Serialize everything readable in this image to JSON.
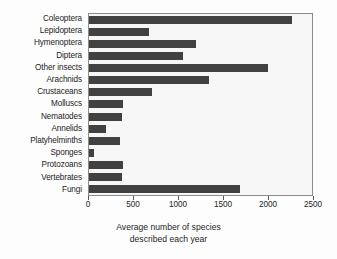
{
  "chart_data": {
    "type": "bar",
    "orientation": "horizontal",
    "title": "",
    "xlabel": "Average number of species described each year",
    "xlabel_lines": [
      "Average number of species",
      "described each year"
    ],
    "ylabel": "",
    "xlim": [
      0,
      2500
    ],
    "xticks": [
      0,
      500,
      1000,
      1500,
      2000,
      2500
    ],
    "xtick_labels": [
      "0",
      "500",
      "1000",
      "1500",
      "2000",
      "2500"
    ],
    "grid": false,
    "legend": false,
    "bar_color": "#414141",
    "plot_background": "#f7f7f7",
    "frame_color": "#8c8c8c",
    "categories": [
      "Coleoptera",
      "Lepidoptera",
      "Hymenoptera",
      "Diptera",
      "Other insects",
      "Arachnids",
      "Crustaceans",
      "Molluscs",
      "Nematodes",
      "Annelids",
      "Platyhelminths",
      "Sponges",
      "Protozoans",
      "Vertebrates",
      "Fungi"
    ],
    "values": [
      2280,
      670,
      1200,
      1055,
      2005,
      1345,
      710,
      380,
      375,
      190,
      345,
      60,
      380,
      370,
      1690
    ]
  }
}
